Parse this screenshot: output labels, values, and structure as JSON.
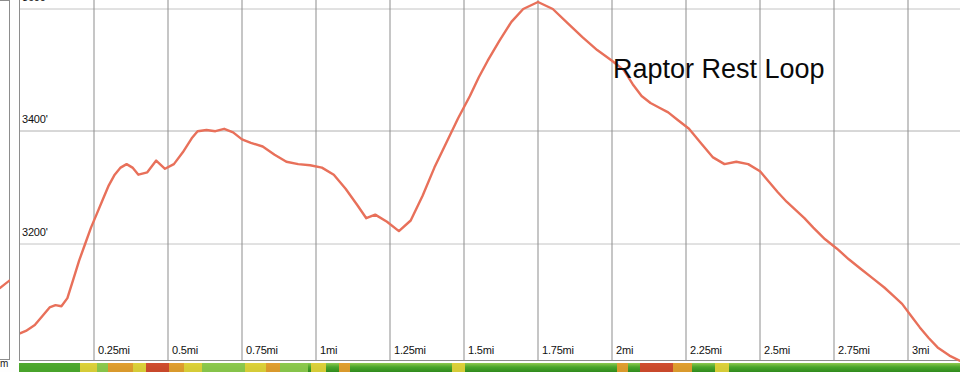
{
  "chart_data": {
    "type": "line",
    "title": "Raptor Rest Loop",
    "xlabel": "",
    "ylabel": "",
    "grid": true,
    "legend": "none",
    "xlim": [
      0,
      3.18
    ],
    "ylim": [
      2960,
      3620
    ],
    "x_unit": "mi",
    "y_unit": "ft",
    "x_tick_labels": [
      "0.25mi",
      "0.5mi",
      "0.75mi",
      "1mi",
      "1.25mi",
      "1.5mi",
      "1.75mi",
      "2mi",
      "2.25mi",
      "2.5mi",
      "2.75mi",
      "3mi"
    ],
    "x_ticks": [
      0.25,
      0.5,
      0.75,
      1,
      1.25,
      1.5,
      1.75,
      2,
      2.25,
      2.5,
      2.75,
      3
    ],
    "y_tick_labels": [
      "3600'",
      "3400'",
      "3200'"
    ],
    "y_ticks": [
      3600,
      3400,
      3200
    ],
    "line_color": "#e8705a",
    "series": [
      {
        "name": "Elevation",
        "x": [
          0.0,
          0.02,
          0.05,
          0.08,
          0.1,
          0.12,
          0.14,
          0.16,
          0.18,
          0.2,
          0.22,
          0.24,
          0.26,
          0.28,
          0.3,
          0.32,
          0.34,
          0.36,
          0.38,
          0.4,
          0.43,
          0.46,
          0.49,
          0.52,
          0.55,
          0.58,
          0.6,
          0.63,
          0.66,
          0.69,
          0.72,
          0.75,
          0.78,
          0.82,
          0.86,
          0.9,
          0.94,
          0.98,
          1.02,
          1.06,
          1.1,
          1.14,
          1.17,
          1.2,
          1.24,
          1.28,
          1.32,
          1.36,
          1.4,
          1.44,
          1.48,
          1.52,
          1.55,
          1.58,
          1.62,
          1.66,
          1.7,
          1.75,
          1.8,
          1.85,
          1.9,
          1.95,
          2.0,
          2.04,
          2.07,
          2.1,
          2.13,
          2.16,
          2.19,
          2.22,
          2.26,
          2.3,
          2.34,
          2.38,
          2.42,
          2.46,
          2.5,
          2.53,
          2.56,
          2.59,
          2.62,
          2.65,
          2.68,
          2.72,
          2.76,
          2.8,
          2.84,
          2.88,
          2.92,
          2.95,
          2.98,
          3.01,
          3.04,
          3.07,
          3.1,
          3.14,
          3.18
        ],
        "values": [
          3048,
          3052,
          3062,
          3080,
          3092,
          3096,
          3094,
          3108,
          3140,
          3172,
          3200,
          3228,
          3252,
          3276,
          3300,
          3318,
          3330,
          3336,
          3330,
          3318,
          3322,
          3342,
          3328,
          3336,
          3356,
          3380,
          3392,
          3394,
          3392,
          3396,
          3390,
          3378,
          3372,
          3366,
          3352,
          3340,
          3336,
          3334,
          3330,
          3318,
          3294,
          3266,
          3244,
          3250,
          3238,
          3222,
          3240,
          3282,
          3330,
          3372,
          3414,
          3452,
          3484,
          3512,
          3546,
          3578,
          3600,
          3612,
          3600,
          3576,
          3552,
          3530,
          3512,
          3496,
          3472,
          3452,
          3440,
          3432,
          3424,
          3412,
          3396,
          3372,
          3348,
          3336,
          3340,
          3336,
          3324,
          3306,
          3288,
          3272,
          3258,
          3244,
          3228,
          3208,
          3192,
          3174,
          3158,
          3142,
          3126,
          3112,
          3098,
          3078,
          3058,
          3040,
          3024,
          3010,
          3000
        ],
        "note": "values listed left-to-right; profile continues below"
      }
    ],
    "key_points": [
      {
        "x": 0.0,
        "y": 3048,
        "label": "start"
      },
      {
        "x": 0.3,
        "y": 3390,
        "label": "first rise"
      },
      {
        "x": 0.36,
        "y": 3392,
        "label": "local high"
      },
      {
        "x": 0.5,
        "y": 3300,
        "label": "dip"
      },
      {
        "x": 0.6,
        "y": 3220,
        "label": "low saddle"
      },
      {
        "x": 1.15,
        "y": 3612,
        "label": "summit"
      },
      {
        "x": 1.55,
        "y": 3335,
        "label": "shelf"
      },
      {
        "x": 2.0,
        "y": 3118,
        "label": "descent"
      },
      {
        "x": 2.24,
        "y": 3000,
        "label": "valley floor"
      },
      {
        "x": 2.52,
        "y": 2998,
        "label": "valley end"
      },
      {
        "x": 2.9,
        "y": 3255,
        "label": "final bump"
      },
      {
        "x": 3.18,
        "y": 3105,
        "label": "end"
      }
    ]
  },
  "title": "Raptor Rest Loop",
  "axes": {
    "y_labels": [
      "3600'",
      "3400'",
      "3200'"
    ],
    "x_labels": [
      "0.25mi",
      "0.5mi",
      "0.75mi",
      "1mi",
      "1.25mi",
      "1.5mi",
      "1.75mi",
      "2mi",
      "2.25mi",
      "2.5mi",
      "2.75mi",
      "3mi"
    ]
  },
  "left_panel": {
    "clipped_label": "m"
  },
  "colors": {
    "elevation_line": "#e8705a",
    "grid": "#b9b9b9",
    "frame": "#8d8d8d",
    "grade_green": "#4aa52c",
    "grade_yellow": "#e7d23a",
    "grade_orange": "#eb9a2e",
    "grade_red": "#d8402c",
    "text": "#111111"
  },
  "grade_strip": {
    "name": "grade-difficulty-strip",
    "segments": [
      {
        "start_pct": 0.0,
        "width_pct": 6.5,
        "color": "#4aa52c"
      },
      {
        "start_pct": 6.5,
        "width_pct": 1.8,
        "color": "#e7d23a"
      },
      {
        "start_pct": 8.3,
        "width_pct": 1.2,
        "color": "#8fc94f"
      },
      {
        "start_pct": 9.5,
        "width_pct": 2.6,
        "color": "#eb9a2e"
      },
      {
        "start_pct": 12.1,
        "width_pct": 1.4,
        "color": "#e7d23a"
      },
      {
        "start_pct": 13.5,
        "width_pct": 2.4,
        "color": "#d8402c"
      },
      {
        "start_pct": 15.9,
        "width_pct": 1.6,
        "color": "#eb9a2e"
      },
      {
        "start_pct": 17.5,
        "width_pct": 2.0,
        "color": "#e7d23a"
      },
      {
        "start_pct": 19.5,
        "width_pct": 4.5,
        "color": "#8fc94f"
      },
      {
        "start_pct": 24.0,
        "width_pct": 2.2,
        "color": "#e7d23a"
      },
      {
        "start_pct": 26.2,
        "width_pct": 1.5,
        "color": "#eb9a2e"
      },
      {
        "start_pct": 27.7,
        "width_pct": 3.0,
        "color": "#8fc94f"
      },
      {
        "start_pct": 31.0,
        "width_pct": 1.6,
        "color": "#e7d23a"
      },
      {
        "start_pct": 34.0,
        "width_pct": 1.2,
        "color": "#eb9a2e"
      },
      {
        "start_pct": 46.0,
        "width_pct": 1.4,
        "color": "#e7d23a"
      },
      {
        "start_pct": 63.5,
        "width_pct": 1.2,
        "color": "#eb9a2e"
      },
      {
        "start_pct": 66.0,
        "width_pct": 3.5,
        "color": "#d8402c"
      },
      {
        "start_pct": 69.5,
        "width_pct": 2.0,
        "color": "#eb9a2e"
      },
      {
        "start_pct": 74.0,
        "width_pct": 1.5,
        "color": "#e7d23a"
      }
    ]
  }
}
